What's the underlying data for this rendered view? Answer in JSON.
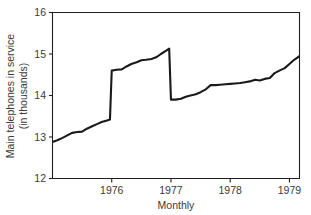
{
  "chart_data": {
    "type": "line",
    "title": "",
    "xlabel": "Monthly",
    "ylabel": "Main telephones in service (in thousands)",
    "ylabel_line1": "Main telephones in service",
    "ylabel_line2": "(in thousands)",
    "xlim": [
      1975.0,
      1979.17
    ],
    "ylim": [
      12,
      16
    ],
    "yticks": [
      12,
      13,
      14,
      15,
      16
    ],
    "ytick_labels": [
      "12",
      "13",
      "14",
      "15",
      "16"
    ],
    "xticks": [
      1976,
      1977,
      1978,
      1979
    ],
    "xtick_labels": [
      "1976",
      "1977",
      "1978",
      "1979"
    ],
    "grid": false,
    "legend": null,
    "series": [
      {
        "name": "Main telephones in service",
        "x": [
          1975.0,
          1975.08,
          1975.17,
          1975.25,
          1975.33,
          1975.42,
          1975.5,
          1975.58,
          1975.67,
          1975.75,
          1975.83,
          1975.92,
          1975.97,
          1976.0,
          1976.08,
          1976.17,
          1976.25,
          1976.33,
          1976.42,
          1976.5,
          1976.58,
          1976.67,
          1976.75,
          1976.83,
          1976.92,
          1976.97,
          1977.0,
          1977.08,
          1977.17,
          1977.25,
          1977.33,
          1977.42,
          1977.5,
          1977.58,
          1977.67,
          1977.75,
          1977.83,
          1977.92,
          1978.0,
          1978.08,
          1978.17,
          1978.25,
          1978.33,
          1978.42,
          1978.5,
          1978.58,
          1978.67,
          1978.75,
          1978.83,
          1978.92,
          1979.0,
          1979.08,
          1979.17
        ],
        "y": [
          12.88,
          12.92,
          12.98,
          13.04,
          13.1,
          13.12,
          13.13,
          13.2,
          13.26,
          13.31,
          13.36,
          13.4,
          13.42,
          14.6,
          14.62,
          14.63,
          14.7,
          14.76,
          14.8,
          14.85,
          14.86,
          14.88,
          14.92,
          15.0,
          15.08,
          15.13,
          13.9,
          13.9,
          13.92,
          13.97,
          14.0,
          14.03,
          14.08,
          14.14,
          14.25,
          14.25,
          14.26,
          14.27,
          14.28,
          14.29,
          14.3,
          14.32,
          14.34,
          14.38,
          14.36,
          14.4,
          14.42,
          14.54,
          14.6,
          14.66,
          14.76,
          14.86,
          14.95
        ]
      }
    ]
  }
}
